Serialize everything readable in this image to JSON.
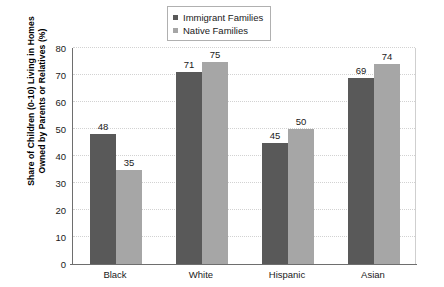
{
  "chart_data": {
    "type": "bar",
    "title": "",
    "xlabel": "",
    "ylabel": "Share of Children (0-10) Living in Homes Owned by Parents or Relatives (%)",
    "ylabel_line1": "Share of Children (0-10) Living in Homes",
    "ylabel_line2": "Owned by Parents or Relatives (%)",
    "categories": [
      "Black",
      "White",
      "Hispanic",
      "Asian"
    ],
    "series": [
      {
        "name": "Immigrant Families",
        "color": "#595959",
        "values": [
          48,
          71,
          45,
          69
        ]
      },
      {
        "name": "Native Families",
        "color": "#a6a6a6",
        "values": [
          35,
          75,
          50,
          74
        ]
      }
    ],
    "ylim": [
      0,
      80
    ],
    "yticks": [
      0,
      10,
      20,
      30,
      40,
      50,
      60,
      70,
      80
    ],
    "ytick_labels": [
      "0",
      "10",
      "20",
      "30",
      "40",
      "50",
      "60",
      "70",
      "80"
    ],
    "grid": true,
    "grid_axis": "y",
    "legend_position": "top-center",
    "data_labels": true,
    "background_color": "#ffffff",
    "axis_color": "#6e6e6e",
    "gridline_color": "#d2d2d2"
  }
}
